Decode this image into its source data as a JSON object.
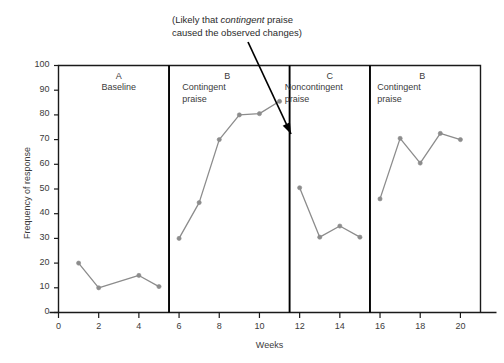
{
  "chart_data": {
    "type": "line",
    "title": "",
    "xlabel": "Weeks",
    "ylabel": "Frequency of response",
    "xlim": [
      0,
      21
    ],
    "ylim": [
      0,
      100
    ],
    "xticks": [
      0,
      2,
      4,
      6,
      8,
      10,
      12,
      14,
      16,
      18,
      20
    ],
    "yticks": [
      0,
      10,
      20,
      30,
      40,
      50,
      60,
      70,
      80,
      90,
      100
    ],
    "grid": false,
    "legend": "none",
    "series": [
      {
        "name": "A Baseline",
        "x": [
          1,
          2,
          4,
          5
        ],
        "values": [
          20,
          10,
          15,
          10.5
        ]
      },
      {
        "name": "B Contingent praise",
        "x": [
          6,
          7,
          8,
          9,
          10,
          11
        ],
        "values": [
          30,
          44.5,
          70,
          80,
          80.5,
          85.5
        ]
      },
      {
        "name": "C Noncontingent praise",
        "x": [
          12,
          13,
          14,
          15
        ],
        "values": [
          50.5,
          30.5,
          35,
          30.5
        ]
      },
      {
        "name": "B Contingent praise (2)",
        "x": [
          16,
          17,
          18,
          19,
          20
        ],
        "values": [
          46,
          70.5,
          60.5,
          72.5,
          70
        ]
      }
    ],
    "phase_dividers": [
      5.5,
      11.5,
      15.5
    ],
    "phases": [
      {
        "letter": "A",
        "name": "Baseline",
        "name2": "",
        "center_x": 3.0
      },
      {
        "letter": "B",
        "name": "Contingent",
        "name2": "praise",
        "center_x": 8.4
      },
      {
        "letter": "C",
        "name": "Noncontingent",
        "name2": "praise",
        "center_x": 13.5
      },
      {
        "letter": "B",
        "name": "Contingent",
        "name2": "praise",
        "center_x": 18.1
      }
    ],
    "annotations": [
      {
        "line1_pre": "(Likely that ",
        "line1_em": "contingent",
        "line1_post": " praise",
        "line2": "caused the observed changes)",
        "arrow_from": {
          "x": 248,
          "y": 42
        },
        "arrow_to": {
          "x": 291,
          "y": 134
        }
      }
    ],
    "colors": {
      "series": "#8c8c8c",
      "marker": "#8c8c8c",
      "axis": "#1a1a1a",
      "divider": "#000000",
      "arrow": "#000000",
      "text": "#3b3b3b",
      "background": "#ffffff"
    }
  }
}
